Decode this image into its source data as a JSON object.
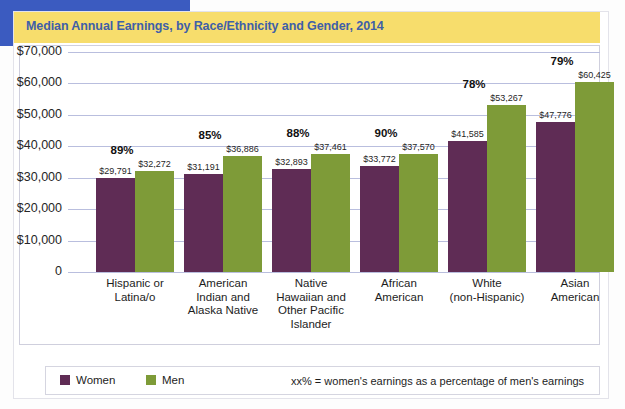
{
  "header": {
    "title": "Median Annual Earnings, by Race/Ethnicity and Gender, 2014"
  },
  "colors": {
    "title_bar": "#f7dd6c",
    "title_text": "#3f5fa8",
    "women": "#5f2c55",
    "men": "#7e9b38",
    "gridline": "#b9bede",
    "accent_blue": "#3b5bc0"
  },
  "legend": {
    "items": [
      {
        "label": "Women",
        "color": "#5f2c55"
      },
      {
        "label": "Men",
        "color": "#7e9b38"
      }
    ],
    "note": "xx% = women's earnings as a percentage of men's earnings"
  },
  "chart_data": {
    "type": "bar",
    "title": "Median Annual Earnings, by Race/Ethnicity and Gender, 2014",
    "xlabel": "",
    "ylabel": "",
    "ylim": [
      0,
      70000
    ],
    "grid": true,
    "legend_position": "bottom",
    "ytick_labels": [
      "$70,000",
      "$60,000",
      "$50,000",
      "$40,000",
      "$30,000",
      "$20,000",
      "$10,000",
      "0"
    ],
    "ytick_values": [
      70000,
      60000,
      50000,
      40000,
      30000,
      20000,
      10000,
      0
    ],
    "categories": [
      "Hispanic or Latina/o",
      "American Indian and Alaska Native",
      "Native Hawaiian and Other Pacific Islander",
      "African American",
      "White (non-Hispanic)",
      "Asian American"
    ],
    "category_lines": [
      [
        "Hispanic or",
        "Latina/o"
      ],
      [
        "American",
        "Indian and",
        "Alaska Native"
      ],
      [
        "Native",
        "Hawaiian and",
        "Other Pacific",
        "Islander"
      ],
      [
        "African",
        "American"
      ],
      [
        "White",
        "(non-Hispanic)"
      ],
      [
        "Asian",
        "American"
      ]
    ],
    "series": [
      {
        "name": "Women",
        "color": "#5f2c55",
        "values": [
          29791,
          31191,
          32893,
          33772,
          41585,
          47776
        ],
        "labels": [
          "$29,791",
          "$31,191",
          "$32,893",
          "$33,772",
          "$41,585",
          "$47,776"
        ]
      },
      {
        "name": "Men",
        "color": "#7e9b38",
        "values": [
          32272,
          36886,
          37461,
          37570,
          53267,
          60425
        ],
        "labels": [
          "$32,272",
          "$36,886",
          "$37,461",
          "$37,570",
          "$53,267",
          "$60,425"
        ]
      }
    ],
    "annotations": {
      "ratio_labels": [
        "89%",
        "85%",
        "88%",
        "90%",
        "78%",
        "79%"
      ],
      "ratio_values": [
        89,
        85,
        88,
        90,
        78,
        79
      ],
      "ratio_note": "xx% = women's earnings as a percentage of men's earnings"
    }
  }
}
